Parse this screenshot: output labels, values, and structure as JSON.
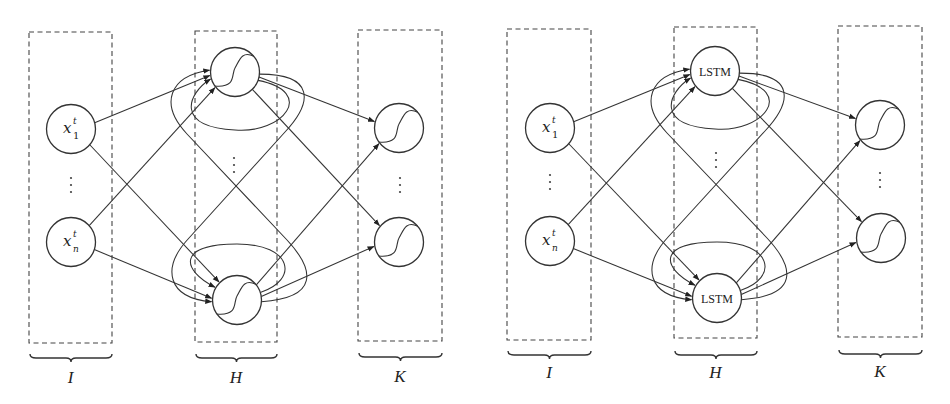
{
  "figure": {
    "panels": [
      {
        "id": "rnn",
        "hidden_label": "",
        "layers": [
          {
            "name": "I",
            "box": [
              29,
              32,
              83,
              311
            ],
            "brace_y": 358,
            "label_y": 383
          },
          {
            "name": "H",
            "box": [
              195,
              31,
              82,
              311
            ],
            "brace_y": 358,
            "label_y": 383
          },
          {
            "name": "K",
            "box": [
              358,
              30,
              84,
              311
            ],
            "brace_y": 357,
            "label_y": 382
          }
        ],
        "inputs": [
          {
            "id": "x1",
            "cx": 71,
            "cy": 129,
            "label": "x",
            "sup": "t",
            "sub": "1"
          },
          {
            "id": "xn",
            "cx": 71,
            "cy": 242,
            "label": "x",
            "sup": "t",
            "sub": "n"
          }
        ],
        "input_dots": {
          "x": 71,
          "y": 185
        },
        "hidden": [
          {
            "id": "h1",
            "cx": 235,
            "cy": 72
          },
          {
            "id": "hn",
            "cx": 237,
            "cy": 300
          }
        ],
        "hidden_dots": {
          "x": 234,
          "y": 165
        },
        "outputs": [
          {
            "id": "k1",
            "cx": 399,
            "cy": 128
          },
          {
            "id": "kn",
            "cx": 399,
            "cy": 242
          }
        ],
        "output_dots": {
          "x": 400,
          "y": 185
        },
        "hidden_type": "sigmoid"
      },
      {
        "id": "lstm",
        "hidden_label": "LSTM",
        "layers": [
          {
            "name": "I",
            "box": [
              507,
              29,
              84,
              311
            ],
            "brace_y": 355,
            "label_y": 378
          },
          {
            "name": "H",
            "box": [
              674,
              27,
              83,
              311
            ],
            "brace_y": 355,
            "label_y": 378
          },
          {
            "name": "K",
            "box": [
              838,
              26,
              84,
              311
            ],
            "brace_y": 354,
            "label_y": 377
          }
        ],
        "inputs": [
          {
            "id": "x1",
            "cx": 550,
            "cy": 128,
            "label": "x",
            "sup": "t",
            "sub": "1"
          },
          {
            "id": "xn",
            "cx": 550,
            "cy": 241,
            "label": "x",
            "sup": "t",
            "sub": "n"
          }
        ],
        "input_dots": {
          "x": 550,
          "y": 182
        },
        "hidden": [
          {
            "id": "h1",
            "cx": 715,
            "cy": 71
          },
          {
            "id": "hn",
            "cx": 717,
            "cy": 298
          }
        ],
        "hidden_dots": {
          "x": 716,
          "y": 160
        },
        "outputs": [
          {
            "id": "k1",
            "cx": 880,
            "cy": 125
          },
          {
            "id": "kn",
            "cx": 881,
            "cy": 238
          }
        ],
        "output_dots": {
          "x": 880,
          "y": 180
        },
        "hidden_type": "lstm"
      }
    ],
    "node_radius": 24.5,
    "colors": {
      "stroke": "#333333",
      "box": "#444444",
      "background": "#ffffff"
    }
  }
}
